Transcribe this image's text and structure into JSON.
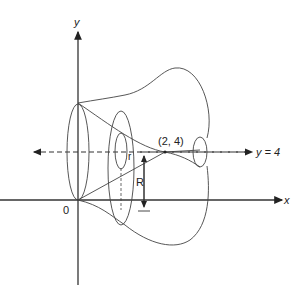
{
  "figure": {
    "type": "solid-of-revolution",
    "axis_of_revolution": "y = 4",
    "labels": {
      "y_axis": "y",
      "x_axis": "x",
      "origin": "0",
      "point": "(2, 4)",
      "line": "y = 4",
      "inner_radius": "r",
      "outer_radius": "R"
    }
  }
}
